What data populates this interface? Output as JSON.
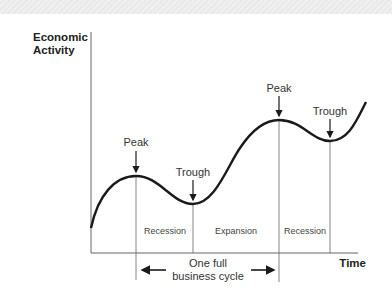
{
  "diagram": {
    "title": "Business cycle",
    "y_axis_label_line1": "Economic",
    "y_axis_label_line2": "Activity",
    "x_axis_label": "Time",
    "points": [
      {
        "label": "Peak",
        "x": 136,
        "y": 176
      },
      {
        "label": "Trough",
        "x": 193,
        "y": 204
      },
      {
        "label": "Peak",
        "x": 279,
        "y": 120
      },
      {
        "label": "Trough",
        "x": 330,
        "y": 141
      }
    ],
    "phases": [
      "Recession",
      "Expansion",
      "Recession"
    ],
    "cycle_label_line1": "One full",
    "cycle_label_line2": "business cycle",
    "colors": {
      "line": "#1a1a1a",
      "text": "#333333",
      "axis": "#666666"
    }
  }
}
